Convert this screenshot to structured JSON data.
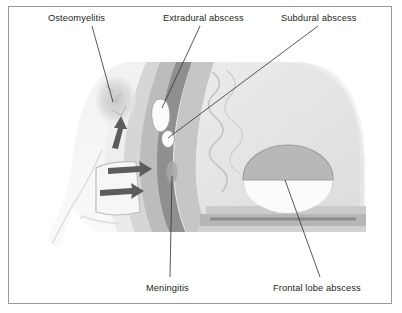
{
  "figure": {
    "type": "medical-illustration",
    "view": "sagittal cross-section of skull and brain",
    "style": "grayscale line and tone drawing",
    "border_color": "#9a9a9a",
    "background_color": "#ffffff"
  },
  "labels": [
    {
      "id": "osteomyelitis",
      "text": "Osteomyelitis",
      "x": 48,
      "y": 13,
      "anchor_x": 113,
      "anchor_y": 102
    },
    {
      "id": "extradural-abscess",
      "text": "Extradural abscess",
      "x": 163,
      "y": 13,
      "anchor_x": 162,
      "anchor_y": 108
    },
    {
      "id": "subdural-abscess",
      "text": "Subdural abscess",
      "x": 281,
      "y": 13,
      "anchor_x": 168,
      "anchor_y": 138
    },
    {
      "id": "meningitis",
      "text": "Meningitis",
      "x": 146,
      "y": 283,
      "anchor_x": 172,
      "anchor_y": 176
    },
    {
      "id": "frontal-lobe-abscess",
      "text": "Frontal lobe abscess",
      "x": 273,
      "y": 283,
      "anchor_x": 285,
      "anchor_y": 180
    }
  ],
  "anatomy": {
    "regions": [
      {
        "name": "scalp-soft-tissue",
        "tone": "#ededed"
      },
      {
        "name": "skull-bone-outer",
        "tone": "#d8d8d8"
      },
      {
        "name": "diploe-bone",
        "tone": "#b9b9b9"
      },
      {
        "name": "dura-mater",
        "tone": "#8e8e8e"
      },
      {
        "name": "subarachnoid-space",
        "tone": "#c9c9c9"
      },
      {
        "name": "brain-frontal-lobe",
        "tone": "#e4e4e4"
      },
      {
        "name": "frontal-sinus-cavity",
        "tone": "#f4f4f4"
      },
      {
        "name": "facial-soft-tissue",
        "tone": "#f1f1f1"
      }
    ],
    "lesions": [
      {
        "name": "osteomyelitis-bone-destruction",
        "appearance": "mottled irregular lucency in frontal bone"
      },
      {
        "name": "extradural-abscess-collection",
        "appearance": "elongated white lens-shaped collection outside dura"
      },
      {
        "name": "subdural-abscess-collection",
        "appearance": "small white oval collection beneath dura"
      },
      {
        "name": "meningitis-inflammation",
        "appearance": "small darker oval in meningeal layer"
      },
      {
        "name": "frontal-lobe-abscess-cavity",
        "appearance": "round cavity with horizontal air-fluid level"
      }
    ],
    "arrows": {
      "name": "infection-spread-arrows",
      "count": 3,
      "meaning": "direction of infection spread from frontal sinus into bone and cranial cavity"
    }
  }
}
